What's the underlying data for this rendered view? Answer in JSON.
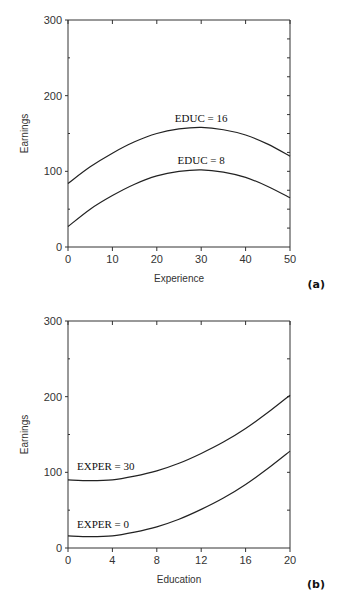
{
  "chart_data": [
    {
      "type": "line",
      "panel_label": "(a)",
      "title": "",
      "xlabel": "Experience",
      "ylabel": "Earnings",
      "xlim": [
        0,
        50
      ],
      "ylim": [
        0,
        300
      ],
      "xticks": [
        0,
        10,
        20,
        30,
        40,
        50
      ],
      "yticks": [
        0,
        100,
        200,
        300
      ],
      "grid": false,
      "x": [
        0,
        5,
        10,
        15,
        20,
        25,
        30,
        35,
        40,
        45,
        50
      ],
      "series": [
        {
          "name": "EDUC = 16",
          "values": [
            84,
            106,
            124,
            139,
            150,
            156,
            158,
            155,
            148,
            136,
            120
          ]
        },
        {
          "name": "EDUC = 8",
          "values": [
            27,
            50,
            68,
            83,
            94,
            100,
            102,
            99,
            92,
            80,
            65
          ]
        }
      ],
      "annotations": [
        {
          "text": "EDUC = 16",
          "x": 30,
          "y": 165
        },
        {
          "text": "EDUC = 8",
          "x": 30,
          "y": 110
        }
      ]
    },
    {
      "type": "line",
      "panel_label": "(b)",
      "title": "",
      "xlabel": "Education",
      "ylabel": "Earnings",
      "xlim": [
        0,
        20
      ],
      "ylim": [
        0,
        300
      ],
      "xticks": [
        0,
        4,
        8,
        12,
        16,
        20
      ],
      "yticks": [
        0,
        100,
        200,
        300
      ],
      "grid": false,
      "x": [
        0,
        2,
        4,
        6,
        8,
        10,
        12,
        14,
        16,
        18,
        20
      ],
      "series": [
        {
          "name": "EXPER = 30",
          "values": [
            90,
            89,
            90,
            95,
            102,
            112,
            125,
            140,
            158,
            179,
            202
          ]
        },
        {
          "name": "EXPER = 0",
          "values": [
            16,
            15,
            16,
            21,
            28,
            38,
            51,
            66,
            84,
            105,
            128
          ]
        }
      ],
      "annotations": [
        {
          "text": "EXPER = 30",
          "x": 4,
          "y": 103
        },
        {
          "text": "EXPER = 0",
          "x": 4,
          "y": 26
        }
      ]
    }
  ]
}
